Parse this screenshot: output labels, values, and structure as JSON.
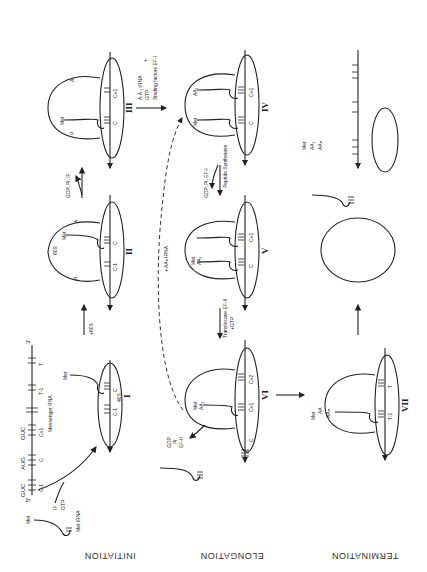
{
  "figure": {
    "orientation": "rotated-90",
    "sections": [
      "INITIATION",
      "ELONGATION",
      "TERMINATION"
    ],
    "initiation": {
      "met_trna_label": "Met tRNA",
      "met_label": "Met",
      "factor_label_1": "IF",
      "factor_label_2": "GTP",
      "mrna": {
        "five_prime": "5'",
        "three_prime": "3'",
        "codons": [
          "GUC",
          "AUG",
          "GUC"
        ],
        "positions": [
          "C-1",
          "C",
          "C+1",
          "T-1",
          "T"
        ],
        "label": "Messenger RNA"
      },
      "step_I": {
        "numeral": "I",
        "subunit": "40S",
        "met": "Met",
        "sites": [
          "C-1",
          "C"
        ]
      },
      "arrow_I_II": "+60S",
      "step_II": {
        "numeral": "II",
        "subunit": "60S",
        "met": "Met",
        "p_site": "P",
        "a_site": "A",
        "sites": [
          "C-1",
          "C"
        ]
      },
      "arrow_II_III_release": "GDP, Pi, IF",
      "step_III": {
        "numeral": "III",
        "met": "Met",
        "p_site": "P",
        "a_site": "A",
        "sites": [
          "C",
          "C+1"
        ]
      },
      "arrow_III_IV_label": [
        "A.A.₁ tRNA",
        "GTP",
        "+",
        "Binding factors EF-I"
      ]
    },
    "elongation": {
      "step_IV": {
        "numeral": "IV",
        "met": "Met",
        "aa": "AA₁",
        "sites": [
          "C",
          "C+1"
        ]
      },
      "arrow_IV_V_label": [
        "GDP, Pi, EF-I",
        "Peptide Synthetase"
      ],
      "step_V": {
        "numeral": "V",
        "met": "Met",
        "aa": "AA₁",
        "sites": [
          "C",
          "C+1"
        ]
      },
      "arrow_V_VI_label": [
        "Translocase EF-II",
        "+GTP"
      ],
      "step_VI": {
        "numeral": "VI",
        "met": "Met",
        "aa": "AA₁",
        "sites": [
          "C",
          "C+1",
          "C+2"
        ]
      },
      "release_VI": [
        "GDP",
        "Pi",
        "EF-II"
      ],
      "loop_label": "+ AAₙ tRNA"
    },
    "termination": {
      "step_VII": {
        "numeral": "VII",
        "chain": [
          "Met",
          "AA",
          "AAₙ"
        ],
        "sites": [
          "T-1",
          "T"
        ]
      },
      "peptide_chain": [
        "Met",
        "AA₁",
        "AAₙ"
      ]
    }
  }
}
